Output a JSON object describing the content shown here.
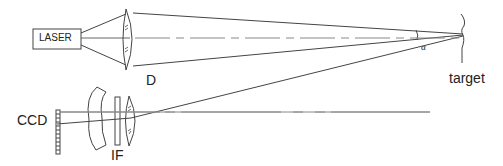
{
  "diagram": {
    "type": "optical-setup",
    "labels": {
      "laser": "LASER",
      "lens_d": "D",
      "target": "target",
      "ccd": "CCD",
      "filter": "IF",
      "angle": "α"
    },
    "colors": {
      "stroke": "#444444",
      "axis": "#888888",
      "text": "#222222"
    }
  }
}
